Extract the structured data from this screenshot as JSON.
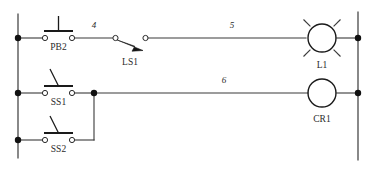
{
  "diagram": {
    "type": "ladder-logic",
    "colors": {
      "wire": "#3a3a3a",
      "symbol": "#1a1a1a",
      "node": "#111111",
      "background": "#ffffff",
      "text": "#2b2b2b"
    },
    "rails": {
      "left_label": "left-power-rail",
      "right_label": "right-power-rail"
    },
    "rungs": [
      {
        "id": "rung-1",
        "wire_numbers": [
          "4",
          "5"
        ],
        "devices": [
          "PB2",
          "LS1",
          "L1"
        ]
      },
      {
        "id": "rung-2",
        "wire_numbers": [
          "6"
        ],
        "devices": [
          "SS1",
          "SS2",
          "CR1"
        ]
      }
    ],
    "components": {
      "pb2": {
        "label": "PB2",
        "symbol": "normally-closed-pushbutton"
      },
      "ls1": {
        "label": "LS1",
        "symbol": "limit-switch-normally-open"
      },
      "l1": {
        "label": "L1",
        "symbol": "pilot-lamp"
      },
      "ss1": {
        "label": "SS1",
        "symbol": "selector-switch-normally-open"
      },
      "ss2": {
        "label": "SS2",
        "symbol": "selector-switch-normally-open"
      },
      "cr1": {
        "label": "CR1",
        "symbol": "relay-coil"
      }
    },
    "wire_labels": {
      "w4": "4",
      "w5": "5",
      "w6": "6"
    }
  }
}
